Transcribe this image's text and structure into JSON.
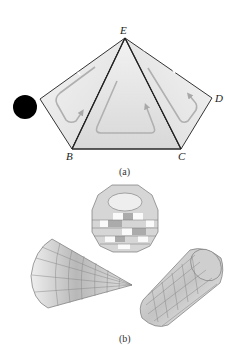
{
  "figure": {
    "part_a": {
      "caption": "(a)",
      "vertices": {
        "E": "E",
        "D": "D",
        "B": "B",
        "C": "C",
        "A": "A"
      },
      "description": "Pentagon ABCDE triangulated from E into three triangles with circulation arrows"
    },
    "part_b": {
      "caption": "(b)",
      "shapes": [
        "faceted sphere",
        "cone",
        "cylinder"
      ]
    },
    "occluder": {
      "color": "#000000",
      "shape": "circle"
    }
  }
}
